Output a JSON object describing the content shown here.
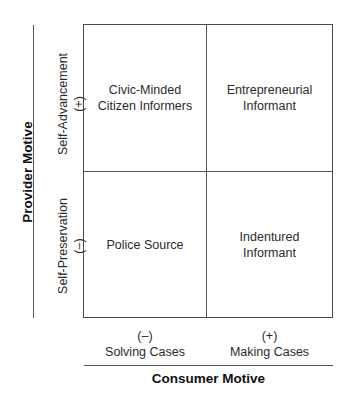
{
  "diagram": {
    "type": "2x2 matrix",
    "y_axis": {
      "title": "Provider Motive",
      "top": {
        "label": "Self-Advancement",
        "sign": "(+)"
      },
      "bottom": {
        "label": "Self-Preservation",
        "sign": "(–)"
      }
    },
    "x_axis": {
      "title": "Consumer Motive",
      "left": {
        "sign": "(–)",
        "label": "Solving Cases"
      },
      "right": {
        "sign": "(+)",
        "label": "Making Cases"
      }
    },
    "quadrants": {
      "top_left": {
        "line1": "Civic-Minded",
        "line2": "Citizen Informers"
      },
      "top_right": {
        "line1": "Entrepreneurial",
        "line2": "Informant"
      },
      "bottom_left": {
        "line1": "Police Source",
        "line2": ""
      },
      "bottom_right": {
        "line1": "Indentured",
        "line2": "Informant"
      }
    }
  }
}
